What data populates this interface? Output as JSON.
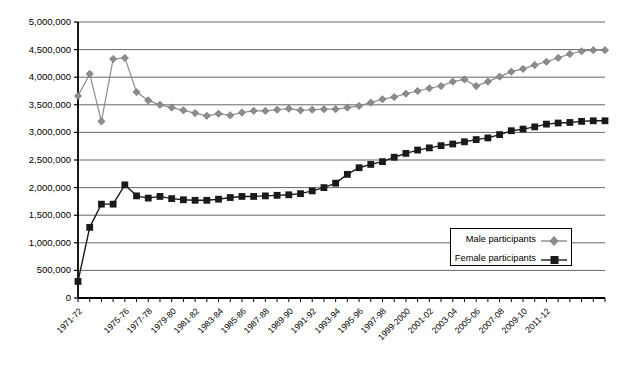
{
  "chart_data": {
    "type": "line",
    "title": "",
    "subtitle": "",
    "xlabel": "",
    "ylabel": "",
    "grid": true,
    "legend_position": "inside-bottom-right",
    "ylim": [
      0,
      5000000
    ],
    "ytick_step": 500000,
    "ytick_labels": [
      "0",
      "500,000",
      "1,000,000",
      "1,500,000",
      "2,000,000",
      "2,500,000",
      "3,000,000",
      "3,500,000",
      "4,000,000",
      "4,500,000",
      "5,000,000"
    ],
    "ytick_values": [
      0,
      500000,
      1000000,
      1500000,
      2000000,
      2500000,
      3000000,
      3500000,
      4000000,
      4500000,
      5000000
    ],
    "categories": [
      "1971-72",
      "1972-73",
      "1973-74",
      "1974-75",
      "1975-76",
      "1976-77",
      "1977-78",
      "1978-79",
      "1979-80",
      "1980-81",
      "1981-82",
      "1982-83",
      "1983-84",
      "1984-85",
      "1985-86",
      "1986-87",
      "1987-88",
      "1988-89",
      "1989-90",
      "1990-91",
      "1991-92",
      "1992-93",
      "1993-94",
      "1994-95",
      "1995-96",
      "1996-97",
      "1997-98",
      "1998-99",
      "1999-2000",
      "2000-01",
      "2001-02",
      "2002-03",
      "2003-04",
      "2004-05",
      "2005-06",
      "2006-07",
      "2007-08",
      "2008-09",
      "2009-10",
      "2010-11",
      "2011-12"
    ],
    "xtick_labels_shown": [
      "1971-72",
      "1975-76",
      "1977-78",
      "1979-80",
      "1981-82",
      "1983-84",
      "1985-86",
      "1987-88",
      "1989-90",
      "1991-92",
      "1993-94",
      "1995-96",
      "1997-98",
      "1999-2000",
      "2001-02",
      "2003-04",
      "2005-06",
      "2007-08",
      "2009-10",
      "2011-12"
    ],
    "series": [
      {
        "name": "Male participants",
        "color": "#8c8c8c",
        "marker": "diamond",
        "values": [
          3660000,
          4060000,
          3200000,
          4330000,
          4350000,
          3730000,
          3580000,
          3500000,
          3450000,
          3400000,
          3350000,
          3300000,
          3340000,
          3310000,
          3360000,
          3390000,
          3390000,
          3410000,
          3430000,
          3400000,
          3410000,
          3420000,
          3420000,
          3450000,
          3480000,
          3540000,
          3600000,
          3640000,
          3700000,
          3750000,
          3800000,
          3840000,
          3920000,
          3960000,
          3840000,
          3920000,
          4010000,
          4100000,
          4150000,
          4220000,
          4280000
        ]
      },
      {
        "name": "Female participants",
        "color": "#1a1a1a",
        "marker": "square",
        "values": [
          300000,
          1280000,
          1700000,
          1700000,
          2050000,
          1850000,
          1810000,
          1840000,
          1800000,
          1780000,
          1770000,
          1770000,
          1790000,
          1820000,
          1840000,
          1840000,
          1850000,
          1860000,
          1870000,
          1890000,
          1940000,
          2000000,
          2080000,
          2240000,
          2360000,
          2420000,
          2470000,
          2550000,
          2620000,
          2680000,
          2720000,
          2760000,
          2790000,
          2830000,
          2870000,
          2900000,
          2960000,
          3030000,
          3060000,
          3100000,
          3150000
        ]
      }
    ],
    "extra_male_tail": [
      4350000,
      4420000,
      4470000,
      4490000,
      4490000
    ],
    "extra_female_tail": [
      3170000,
      3180000,
      3200000,
      3210000,
      3210000
    ]
  },
  "legend": {
    "items": [
      {
        "label": "Male participants",
        "marker": "diamond-marker-icon"
      },
      {
        "label": "Female participants",
        "marker": "square-marker-icon"
      }
    ]
  },
  "colors": {
    "male": "#8c8c8c",
    "female": "#1a1a1a",
    "grid": "#555555",
    "axis": "#000000",
    "background": "#ffffff"
  }
}
